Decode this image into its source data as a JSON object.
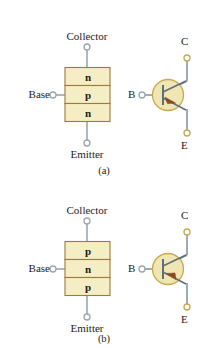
{
  "figure": {
    "colors": {
      "layer_fill": "#f5eec4",
      "layer_border": "#9c7b3a",
      "wire": "#9aa7ac",
      "circle_fill": "#f0e6b4",
      "circle_border": "#c8a94e",
      "symbol_line": "#6b7f8a",
      "arrow": "#8a4b20",
      "text": "#1a1a1a"
    }
  },
  "panels": [
    {
      "id": "a",
      "caption": "(a)",
      "type": "npn",
      "structure": {
        "collector_label": "Collector",
        "base_label": "Base",
        "emitter_label": "Emitter",
        "layers": [
          {
            "letter": "n",
            "role": "collector"
          },
          {
            "letter": "p",
            "role": "base"
          },
          {
            "letter": "n",
            "role": "emitter"
          }
        ]
      },
      "symbol": {
        "collector_label": "C",
        "base_label": "B",
        "emitter_label": "E",
        "arrow_direction": "outward"
      }
    },
    {
      "id": "b",
      "caption": "(b)",
      "type": "pnp",
      "structure": {
        "collector_label": "Collector",
        "base_label": "Base",
        "emitter_label": "Emitter",
        "layers": [
          {
            "letter": "p",
            "role": "collector"
          },
          {
            "letter": "n",
            "role": "base"
          },
          {
            "letter": "p",
            "role": "emitter"
          }
        ]
      },
      "symbol": {
        "collector_label": "C",
        "base_label": "B",
        "emitter_label": "E",
        "arrow_direction": "inward"
      }
    }
  ]
}
